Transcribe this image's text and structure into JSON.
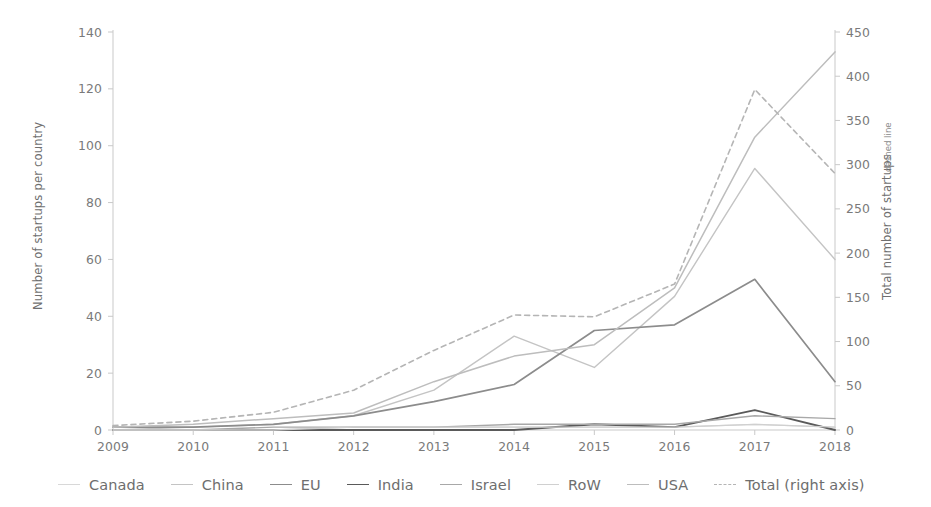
{
  "chart_data": {
    "type": "line",
    "title": "",
    "subtitle": "",
    "xlabel": "",
    "ylabel": "Number of startups per country",
    "ylabel_right": "Total number of startups",
    "ylabel_right_suffix": "dashed line",
    "x": [
      "2009",
      "2010",
      "2011",
      "2012",
      "2013",
      "2014",
      "2015",
      "2016",
      "2017",
      "2018"
    ],
    "categories": [
      "2009",
      "2010",
      "2011",
      "2012",
      "2013",
      "2014",
      "2015",
      "2016",
      "2017",
      "2018"
    ],
    "ylim": [
      0,
      140
    ],
    "yticks": [
      0,
      20,
      40,
      60,
      80,
      100,
      120,
      140
    ],
    "ylim_right": [
      0,
      450
    ],
    "yticks_right": [
      0,
      50,
      100,
      150,
      200,
      250,
      300,
      350,
      400,
      450
    ],
    "grid": false,
    "legend_position": "bottom",
    "series": [
      {
        "name": "Canada",
        "axis": "left",
        "color": "#d8d8d8",
        "dash": false,
        "width": 1.3,
        "values": [
          0,
          0,
          0,
          1,
          1,
          1,
          1,
          1,
          2,
          1
        ]
      },
      {
        "name": "China",
        "axis": "left",
        "color": "#c4c4c4",
        "dash": false,
        "width": 1.4,
        "values": [
          0,
          1,
          2,
          5,
          14,
          33,
          22,
          47,
          92,
          60
        ]
      },
      {
        "name": "EU",
        "axis": "left",
        "color": "#8c8c8c",
        "dash": false,
        "width": 1.7,
        "values": [
          1,
          1,
          2,
          5,
          10,
          16,
          35,
          37,
          53,
          17
        ]
      },
      {
        "name": "India",
        "axis": "left",
        "color": "#5a5a5a",
        "dash": false,
        "width": 1.9,
        "values": [
          0,
          0,
          0,
          0,
          0,
          0,
          2,
          1,
          7,
          0
        ]
      },
      {
        "name": "Israel",
        "axis": "left",
        "color": "#a8a8a8",
        "dash": false,
        "width": 1.4,
        "values": [
          0,
          0,
          1,
          1,
          1,
          2,
          2,
          2,
          5,
          4
        ]
      },
      {
        "name": "RoW",
        "axis": "left",
        "color": "#d0d0d0",
        "dash": false,
        "width": 1.3,
        "values": [
          0,
          0,
          0,
          1,
          1,
          1,
          1,
          1,
          2,
          1
        ]
      },
      {
        "name": "USA",
        "axis": "left",
        "color": "#bdbdbd",
        "dash": false,
        "width": 1.5,
        "values": [
          1,
          2,
          4,
          6,
          17,
          26,
          30,
          50,
          103,
          133
        ]
      },
      {
        "name": "Total (right axis)",
        "axis": "right",
        "color": "#b5b5b5",
        "dash": true,
        "width": 1.6,
        "values": [
          5,
          10,
          20,
          45,
          90,
          130,
          128,
          165,
          385,
          290
        ]
      }
    ],
    "annotations": []
  },
  "legend": {
    "items": [
      {
        "label": "Canada",
        "color": "#d8d8d8",
        "dash": false
      },
      {
        "label": "China",
        "color": "#c4c4c4",
        "dash": false
      },
      {
        "label": "EU",
        "color": "#8c8c8c",
        "dash": false
      },
      {
        "label": "India",
        "color": "#5a5a5a",
        "dash": false
      },
      {
        "label": "Israel",
        "color": "#a8a8a8",
        "dash": false
      },
      {
        "label": "RoW",
        "color": "#d0d0d0",
        "dash": false
      },
      {
        "label": "USA",
        "color": "#bdbdbd",
        "dash": false
      },
      {
        "label": "Total (right axis)",
        "color": "#b5b5b5",
        "dash": true
      }
    ]
  },
  "axis_colors": {
    "axis_line": "#c9c9c9",
    "tick_text": "#7a7a7a",
    "title_text": "#6f6f6f"
  }
}
